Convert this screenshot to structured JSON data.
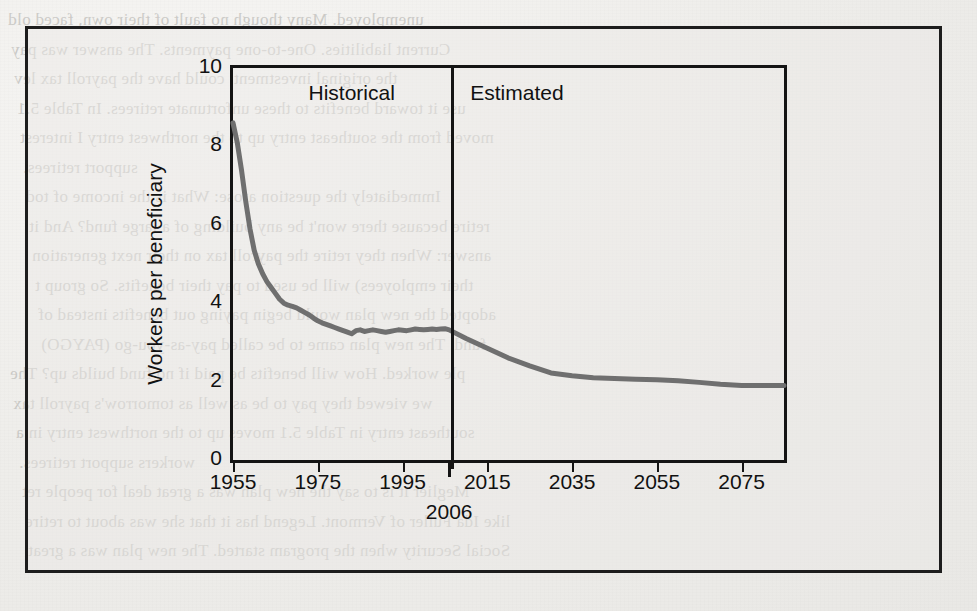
{
  "figure": {
    "background_color": "#eeedea",
    "frame_color": "#1d1d1d",
    "line_color": "#6f6f6f"
  },
  "region_labels": {
    "historical": "Historical",
    "estimated": "Estimated"
  },
  "axis_note": "2006",
  "bleed_text": [
    "unemployed. Many though no fault of their own, faced old",
    "Current liabilities. One-to-one payments. The answer was pay",
    "the original investment. could have the payroll tax lev",
    "use it toward benefits to these unfortunate retirees.  In Table 5.1",
    "moved from the southeast entry up to the northwest entry  I interest",
    "support retirees.",
    "Immediately the question arose: What is the income of tod",
    "retire because there won't be any building of a large fund? And it",
    "answer: When they retire the payroll tax on their next generation",
    "their employees) will be used to pay their benefits. So group t",
    "adopted the new plan would begin paying out benefits instead of",
    "fund. The new plan came to be called pay-as-you-go (PAYGO)",
    "ple worked. How will benefits be paid if no fund builds up? The",
    "we viewed they pay to be as well as tomorrow's payroll tax",
    "southeast entry in Table 5.1 moves up to the northwest entry in a",
    "workers support retirees.",
    "Meglier it is to say the new plan was a great deal for people ret",
    "like Ida Fuller of Vermont. Legend has it that she was about to retire",
    "Social Security when the program started. The new plan was a great"
  ],
  "chart_data": {
    "type": "line",
    "title": "",
    "xlabel": "",
    "ylabel": "Workers per beneficiary",
    "xlim": [
      1955,
      2085
    ],
    "ylim": [
      0,
      10
    ],
    "ytick_labels": [
      "0",
      "2",
      "4",
      "6",
      "8",
      "10"
    ],
    "ytick_values": [
      0,
      2,
      4,
      6,
      8,
      10
    ],
    "xtick_labels": [
      "1955",
      "1975",
      "1995",
      "2015",
      "2035",
      "2055",
      "2075"
    ],
    "xtick_values": [
      1955,
      1975,
      1995,
      2015,
      2035,
      2055,
      2075
    ],
    "grid": false,
    "legend": "none",
    "divider_x": 2006,
    "divider_label": "2006",
    "annotations": [
      {
        "text": "Historical",
        "x": 1983,
        "y": 9.3
      },
      {
        "text": "Estimated",
        "x": 2022,
        "y": 9.3
      }
    ],
    "series": [
      {
        "name": "Workers per beneficiary",
        "color": "#6f6f6f",
        "x": [
          1955,
          1956,
          1957,
          1958,
          1959,
          1960,
          1961,
          1962,
          1963,
          1964,
          1965,
          1966,
          1967,
          1968,
          1969,
          1970,
          1971,
          1972,
          1973,
          1974,
          1975,
          1976,
          1977,
          1978,
          1979,
          1980,
          1981,
          1982,
          1983,
          1984,
          1985,
          1986,
          1987,
          1988,
          1989,
          1990,
          1991,
          1992,
          1993,
          1994,
          1995,
          1996,
          1997,
          1998,
          1999,
          2000,
          2001,
          2002,
          2003,
          2004,
          2005,
          2006,
          2010,
          2015,
          2020,
          2025,
          2030,
          2035,
          2040,
          2045,
          2050,
          2055,
          2060,
          2065,
          2070,
          2075,
          2080,
          2085
        ],
        "y": [
          8.6,
          8.1,
          7.4,
          6.6,
          5.9,
          5.35,
          5.0,
          4.75,
          4.55,
          4.4,
          4.25,
          4.1,
          4.0,
          3.95,
          3.92,
          3.88,
          3.82,
          3.76,
          3.7,
          3.62,
          3.55,
          3.5,
          3.46,
          3.42,
          3.38,
          3.34,
          3.3,
          3.26,
          3.22,
          3.3,
          3.32,
          3.28,
          3.3,
          3.32,
          3.3,
          3.28,
          3.26,
          3.28,
          3.3,
          3.32,
          3.31,
          3.3,
          3.32,
          3.34,
          3.33,
          3.32,
          3.33,
          3.34,
          3.33,
          3.34,
          3.35,
          3.32,
          3.1,
          2.85,
          2.6,
          2.4,
          2.22,
          2.15,
          2.1,
          2.08,
          2.06,
          2.05,
          2.02,
          1.98,
          1.93,
          1.9,
          1.9,
          1.9
        ]
      }
    ]
  }
}
